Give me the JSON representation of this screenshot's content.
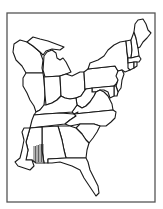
{
  "map": {
    "title": "",
    "style": "black-and-white outline map",
    "region": "Eastern United States",
    "colors": {
      "background": "#ffffff",
      "outline": "#1a1a1a",
      "frame": "#555555"
    },
    "states": [
      {
        "id": "WI",
        "name": "Wisconsin"
      },
      {
        "id": "MI",
        "name": "Michigan"
      },
      {
        "id": "IL",
        "name": "Illinois"
      },
      {
        "id": "IN",
        "name": "Indiana"
      },
      {
        "id": "OH",
        "name": "Ohio"
      },
      {
        "id": "PA",
        "name": "Pennsylvania"
      },
      {
        "id": "NY",
        "name": "New York"
      },
      {
        "id": "VT",
        "name": "Vermont"
      },
      {
        "id": "NH",
        "name": "New Hampshire"
      },
      {
        "id": "ME",
        "name": "Maine"
      },
      {
        "id": "MA",
        "name": "Massachusetts"
      },
      {
        "id": "CT",
        "name": "Connecticut"
      },
      {
        "id": "RI",
        "name": "Rhode Island"
      },
      {
        "id": "NJ",
        "name": "New Jersey"
      },
      {
        "id": "DE",
        "name": "Delaware"
      },
      {
        "id": "MD",
        "name": "Maryland"
      },
      {
        "id": "WV",
        "name": "West Virginia"
      },
      {
        "id": "VA",
        "name": "Virginia"
      },
      {
        "id": "KY",
        "name": "Kentucky"
      },
      {
        "id": "TN",
        "name": "Tennessee"
      },
      {
        "id": "NC",
        "name": "North Carolina"
      },
      {
        "id": "SC",
        "name": "South Carolina"
      },
      {
        "id": "GA",
        "name": "Georgia"
      },
      {
        "id": "AL",
        "name": "Alabama"
      },
      {
        "id": "MS",
        "name": "Mississippi"
      },
      {
        "id": "LA",
        "name": "Louisiana (partial)"
      },
      {
        "id": "FL",
        "name": "Florida"
      }
    ],
    "highlight": {
      "description": "vertical hatching in southern Mississippi/Alabama",
      "pattern": "vertical-lines"
    }
  }
}
